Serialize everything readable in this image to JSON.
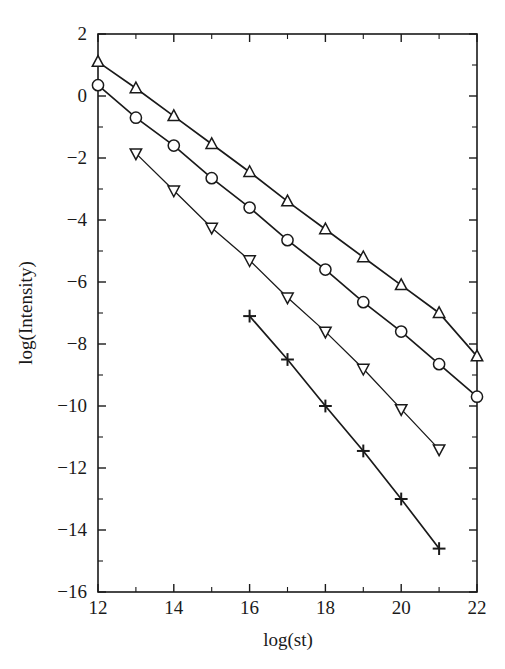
{
  "chart_data": {
    "type": "line",
    "title": "",
    "xlabel": "log(st)",
    "ylabel": "log(Intensity)",
    "xlim": [
      12,
      22
    ],
    "ylim": [
      -16,
      2
    ],
    "xticks": [
      12,
      14,
      16,
      18,
      20,
      22
    ],
    "xtick_labels": [
      "12",
      "14",
      "16",
      "18",
      "20",
      "22"
    ],
    "xticks_minor": [
      13,
      15,
      17,
      19,
      21
    ],
    "yticks": [
      2,
      0,
      -2,
      -4,
      -6,
      -8,
      -10,
      -12,
      -14,
      -16
    ],
    "ytick_labels": [
      "2",
      "0",
      "-2",
      "-4",
      "-6",
      "-8",
      "-10",
      "-12",
      "-14",
      "-16"
    ],
    "yticks_minor": [
      1,
      -1,
      -3,
      -5,
      -7,
      -9,
      -11,
      -13,
      -15
    ],
    "grid": false,
    "legend": "none",
    "frame": "box",
    "line_color": "#1a1a1a",
    "background_color": "#ffffff",
    "series": [
      {
        "name": "up-triangle",
        "marker": "triangle-up",
        "x": [
          12,
          13,
          14,
          15,
          16,
          17,
          18,
          19,
          20,
          21,
          22
        ],
        "values": [
          1.1,
          0.25,
          -0.65,
          -1.55,
          -2.45,
          -3.4,
          -4.3,
          -5.2,
          -6.1,
          -7.0,
          -8.4
        ]
      },
      {
        "name": "circle",
        "marker": "circle",
        "x": [
          12,
          13,
          14,
          15,
          16,
          17,
          18,
          19,
          20,
          21,
          22
        ],
        "values": [
          0.35,
          -0.7,
          -1.6,
          -2.65,
          -3.6,
          -4.65,
          -5.6,
          -6.65,
          -7.6,
          -8.65,
          -9.7
        ]
      },
      {
        "name": "down-triangle",
        "marker": "triangle-down",
        "x": [
          13,
          14,
          15,
          16,
          17,
          18,
          19,
          20,
          21
        ],
        "values": [
          -1.85,
          -3.05,
          -4.25,
          -5.3,
          -6.5,
          -7.6,
          -8.8,
          -10.1,
          -11.4
        ]
      },
      {
        "name": "plus",
        "marker": "plus",
        "x": [
          16,
          17,
          18,
          19,
          20,
          21
        ],
        "values": [
          -7.1,
          -8.5,
          -10.0,
          -11.45,
          -13.0,
          -14.6
        ]
      }
    ]
  }
}
